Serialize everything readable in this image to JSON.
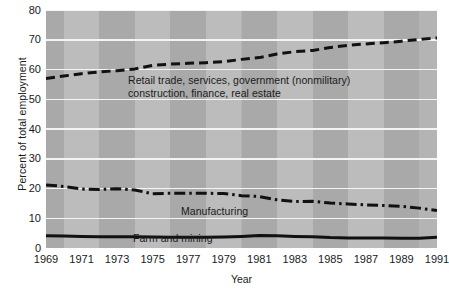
{
  "chart_data": {
    "type": "line",
    "title": "",
    "xlabel": "Year",
    "ylabel": "Percent of total employment",
    "xlim": [
      1969,
      1991
    ],
    "ylim": [
      0,
      80
    ],
    "grid": true,
    "legend": "inline annotations",
    "x": [
      1969,
      1970,
      1971,
      1972,
      1973,
      1974,
      1975,
      1976,
      1977,
      1978,
      1979,
      1980,
      1981,
      1982,
      1983,
      1984,
      1985,
      1986,
      1987,
      1988,
      1989,
      1990,
      1991
    ],
    "xtick_labels": [
      "1969",
      "1971",
      "1973",
      "1975",
      "1977",
      "1979",
      "1981",
      "1983",
      "1985",
      "1987",
      "1989",
      "1991"
    ],
    "xtick_values": [
      1969,
      1971,
      1973,
      1975,
      1977,
      1979,
      1981,
      1983,
      1985,
      1987,
      1989,
      1991
    ],
    "ytick_labels": [
      "0",
      "10",
      "20",
      "30",
      "40",
      "50",
      "60",
      "70",
      "80"
    ],
    "ytick_values": [
      0,
      10,
      20,
      30,
      40,
      50,
      60,
      70,
      80
    ],
    "series": [
      {
        "name": "Retail trade, services, government (nonmilitary) construction, finance, real estate",
        "annotation_lines": [
          "Retail trade, services, government (nonmilitary)",
          "construction, finance, real estate"
        ],
        "style": "dashed",
        "color": "#111111",
        "values": [
          57.0,
          57.8,
          58.6,
          59.2,
          59.6,
          60.2,
          61.4,
          61.8,
          62.1,
          62.3,
          62.6,
          63.4,
          64.0,
          65.2,
          66.0,
          66.4,
          67.4,
          68.1,
          68.6,
          69.0,
          69.5,
          70.1,
          70.6
        ]
      },
      {
        "name": "Manufacturing",
        "annotation_lines": [
          "Manufacturing"
        ],
        "style": "dash-dot",
        "color": "#111111",
        "values": [
          21.2,
          20.7,
          19.8,
          19.7,
          19.9,
          19.5,
          18.2,
          18.4,
          18.4,
          18.4,
          18.3,
          17.6,
          17.3,
          16.2,
          15.6,
          15.7,
          15.1,
          14.8,
          14.5,
          14.3,
          14.0,
          13.4,
          12.6
        ]
      },
      {
        "name": "Farm and mining",
        "annotation_lines": [
          "Farm and mining"
        ],
        "style": "solid",
        "color": "#111111",
        "values": [
          4.1,
          4.0,
          3.9,
          3.8,
          3.8,
          3.8,
          3.7,
          3.6,
          3.6,
          3.6,
          3.7,
          3.9,
          4.2,
          4.1,
          3.9,
          3.8,
          3.5,
          3.4,
          3.4,
          3.4,
          3.3,
          3.3,
          3.6
        ]
      }
    ],
    "colors": {
      "stripe_light": "#bcbcbc",
      "stripe_dark": "#a9a9a9",
      "gridline": "#f4f4f4",
      "line": "#111111",
      "text": "#1a1a1a",
      "background": "#ffffff"
    }
  }
}
